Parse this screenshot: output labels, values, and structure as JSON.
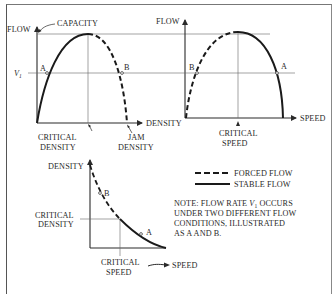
{
  "figure": {
    "panel_flow_density": {
      "y_axis_label": "FLOW",
      "x_axis_label": "DENSITY",
      "capacity_label": "CAPACITY",
      "v1_label": "V",
      "v1_subscript": "1",
      "point_a": "A",
      "point_b": "B",
      "critical_density_line1": "CRITICAL",
      "critical_density_line2": "DENSITY",
      "jam_density_line1": "JAM",
      "jam_density_line2": "DENSITY"
    },
    "panel_flow_speed": {
      "y_axis_label": "FLOW",
      "x_axis_label": "SPEED",
      "point_a": "A",
      "point_b": "B",
      "critical_speed_line1": "CRITICAL",
      "critical_speed_line2": "SPEED"
    },
    "panel_density_speed": {
      "y_axis_label": "DENSITY",
      "x_axis_label": "SPEED",
      "point_a": "A",
      "point_b": "B",
      "critical_density_line1": "CRITICAL",
      "critical_density_line2": "DENSITY",
      "critical_speed_line1": "CRITICAL",
      "critical_speed_line2": "SPEED"
    },
    "legend": {
      "forced_flow": "FORCED FLOW",
      "stable_flow": "STABLE FLOW"
    },
    "note": {
      "line1_prefix": "NOTE: FLOW RATE ",
      "line1_var": "V",
      "line1_sub": "1",
      "line1_suffix": " OCCURS",
      "line2": "UNDER TWO DIFFERENT FLOW",
      "line3": "CONDITIONS, ILLUSTRATED",
      "line4": "AS A AND B."
    }
  }
}
